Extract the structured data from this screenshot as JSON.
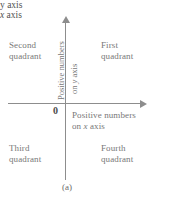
{
  "figure": {
    "caption": "(a)",
    "axes": {
      "x_label_prefix": "x",
      "x_label_suffix": " axis",
      "y_label": "y axis",
      "origin": "0",
      "line_color": "#8d8d8d"
    },
    "quadrants": [
      {
        "name": "second-quadrant",
        "text": "Second\nquadrant"
      },
      {
        "name": "first-quadrant",
        "text": "First\nquadrant"
      },
      {
        "name": "third-quadrant",
        "text": "Third\nquadrant"
      },
      {
        "name": "fourth-quadrant",
        "text": "Fourth\nquadrant"
      }
    ],
    "annotations": {
      "y_positive": "Positive numbers",
      "y_positive_axis_prefix": "on ",
      "y_positive_axis_var": "y",
      "y_positive_axis_suffix": " axis",
      "x_positive_line1": "Positive numbers",
      "x_positive_line2_prefix": "on ",
      "x_positive_line2_var": "x",
      "x_positive_line2_suffix": " axis"
    },
    "colors": {
      "text": "#777777",
      "axis": "#8d8d8d",
      "background": "#ffffff"
    }
  }
}
